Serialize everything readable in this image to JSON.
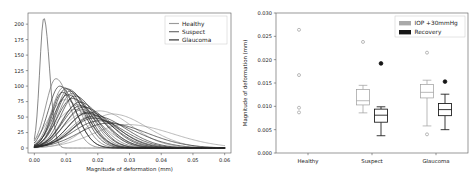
{
  "figure": {
    "panels": 2,
    "background": "#ffffff"
  },
  "chart_data": [
    {
      "id": "left-panel",
      "type": "line",
      "title": "",
      "xlabel": "Magnitude of deformation (mm)",
      "ylabel": "",
      "xlim": [
        -0.002,
        0.062
      ],
      "ylim": [
        -8,
        218
      ],
      "xticks": [
        0.0,
        0.01,
        0.02,
        0.03,
        0.04,
        0.05,
        0.06
      ],
      "xticklabels": [
        "0.00",
        "0.01",
        "0.02",
        "0.03",
        "0.04",
        "0.05",
        "0.06"
      ],
      "yticks": [
        0,
        25,
        50,
        75,
        100,
        125,
        150,
        175,
        200
      ],
      "yticklabels": [
        "0",
        "25",
        "50",
        "75",
        "100",
        "125",
        "150",
        "175",
        "200"
      ],
      "grid": false,
      "legend_position": "upper right",
      "legend": [
        {
          "label": "Healthy",
          "color": "#9a9a9a"
        },
        {
          "label": "Suspect",
          "color": "#6a6a6a"
        },
        {
          "label": "Glaucoma",
          "color": "#2b2b2b"
        }
      ],
      "description": "Overlaid kernel density estimate curves of corneal deformation magnitude for individual subjects in three groups.",
      "series": [
        {
          "name": "Healthy",
          "color": "#9a9a9a",
          "peak_x": 0.0205,
          "peak_y": 60,
          "spread": 0.0072
        },
        {
          "name": "Healthy",
          "color": "#9a9a9a",
          "peak_x": 0.0245,
          "peak_y": 55,
          "spread": 0.008
        },
        {
          "name": "Healthy",
          "color": "#9a9a9a",
          "peak_x": 0.0125,
          "peak_y": 62,
          "spread": 0.0062
        },
        {
          "name": "Healthy",
          "color": "#9a9a9a",
          "peak_x": 0.016,
          "peak_y": 57,
          "spread": 0.0068
        },
        {
          "name": "Healthy",
          "color": "#9a9a9a",
          "peak_x": 0.0095,
          "peak_y": 78,
          "spread": 0.005
        },
        {
          "name": "Healthy",
          "color": "#9a9a9a",
          "peak_x": 0.029,
          "peak_y": 38,
          "spread": 0.0105
        },
        {
          "name": "Suspect",
          "color": "#6a6a6a",
          "peak_x": 0.003,
          "peak_y": 210,
          "spread": 0.0013
        },
        {
          "name": "Suspect",
          "color": "#6a6a6a",
          "peak_x": 0.0068,
          "peak_y": 112,
          "spread": 0.0032
        },
        {
          "name": "Suspect",
          "color": "#6a6a6a",
          "peak_x": 0.0092,
          "peak_y": 98,
          "spread": 0.0038
        },
        {
          "name": "Suspect",
          "color": "#6a6a6a",
          "peak_x": 0.0108,
          "peak_y": 95,
          "spread": 0.004
        },
        {
          "name": "Suspect",
          "color": "#6a6a6a",
          "peak_x": 0.0118,
          "peak_y": 88,
          "spread": 0.0044
        },
        {
          "name": "Suspect",
          "color": "#6a6a6a",
          "peak_x": 0.0135,
          "peak_y": 70,
          "spread": 0.005
        },
        {
          "name": "Suspect",
          "color": "#6a6a6a",
          "peak_x": 0.015,
          "peak_y": 62,
          "spread": 0.0055
        },
        {
          "name": "Suspect",
          "color": "#6a6a6a",
          "peak_x": 0.0175,
          "peak_y": 50,
          "spread": 0.0065
        },
        {
          "name": "Glaucoma",
          "color": "#2b2b2b",
          "peak_x": 0.008,
          "peak_y": 100,
          "spread": 0.0036
        },
        {
          "name": "Glaucoma",
          "color": "#2b2b2b",
          "peak_x": 0.01,
          "peak_y": 96,
          "spread": 0.004
        },
        {
          "name": "Glaucoma",
          "color": "#2b2b2b",
          "peak_x": 0.0112,
          "peak_y": 92,
          "spread": 0.0042
        },
        {
          "name": "Glaucoma",
          "color": "#2b2b2b",
          "peak_x": 0.0128,
          "peak_y": 84,
          "spread": 0.0046
        },
        {
          "name": "Glaucoma",
          "color": "#2b2b2b",
          "peak_x": 0.0142,
          "peak_y": 74,
          "spread": 0.0052
        },
        {
          "name": "Glaucoma",
          "color": "#2b2b2b",
          "peak_x": 0.0155,
          "peak_y": 66,
          "spread": 0.0058
        },
        {
          "name": "Glaucoma",
          "color": "#2b2b2b",
          "peak_x": 0.017,
          "peak_y": 58,
          "spread": 0.0062
        },
        {
          "name": "Glaucoma",
          "color": "#2b2b2b",
          "peak_x": 0.019,
          "peak_y": 52,
          "spread": 0.007
        },
        {
          "name": "Glaucoma",
          "color": "#2b2b2b",
          "peak_x": 0.0088,
          "peak_y": 90,
          "spread": 0.0034
        },
        {
          "name": "Glaucoma",
          "color": "#2b2b2b",
          "peak_x": 0.012,
          "peak_y": 80,
          "spread": 0.0048
        },
        {
          "name": "Glaucoma",
          "color": "#2b2b2b",
          "peak_x": 0.0105,
          "peak_y": 86,
          "spread": 0.0044
        },
        {
          "name": "Glaucoma",
          "color": "#2b2b2b",
          "peak_x": 0.0145,
          "peak_y": 68,
          "spread": 0.0056
        },
        {
          "name": "Glaucoma",
          "color": "#2b2b2b",
          "peak_x": 0.0205,
          "peak_y": 44,
          "spread": 0.0082
        },
        {
          "name": "Glaucoma",
          "color": "#2b2b2b",
          "peak_x": 0.023,
          "peak_y": 40,
          "spread": 0.009
        },
        {
          "name": "Glaucoma",
          "color": "#2b2b2b",
          "peak_x": 0.0165,
          "peak_y": 56,
          "spread": 0.006
        },
        {
          "name": "Glaucoma",
          "color": "#2b2b2b",
          "peak_x": 0.0185,
          "peak_y": 48,
          "spread": 0.0068
        }
      ]
    },
    {
      "id": "right-panel",
      "type": "box",
      "title": "",
      "xlabel": "",
      "ylabel": "Magnitude of deformation (mm)",
      "ylim": [
        0.0,
        0.03
      ],
      "yticks": [
        0.0,
        0.005,
        0.01,
        0.015,
        0.02,
        0.025,
        0.03
      ],
      "yticklabels": [
        "0.000",
        "0.005",
        "0.010",
        "0.015",
        "0.020",
        "0.025",
        "0.030"
      ],
      "categories": [
        "Healthy",
        "Suspect",
        "Glaucoma"
      ],
      "grid": false,
      "legend_position": "upper right",
      "legend": [
        {
          "label": "IOP +30mmHg",
          "color": "#a9a9a9"
        },
        {
          "label": "Recovery",
          "color": "#151515"
        }
      ],
      "boxes": [
        {
          "category": "Healthy",
          "series": "IOP +30mmHg",
          "color": "#a9a9a9",
          "q1": null,
          "median": null,
          "q3": null,
          "whisker_low": null,
          "whisker_high": null,
          "outliers": [
            0.0264,
            0.0167,
            0.0097,
            0.0087
          ],
          "note": "collapsed box, outliers only"
        },
        {
          "category": "Healthy",
          "series": "Recovery",
          "color": "#151515",
          "q1": null,
          "median": null,
          "q3": null,
          "whisker_low": null,
          "whisker_high": null,
          "outliers": [],
          "note": "not drawn"
        },
        {
          "category": "Suspect",
          "series": "IOP +30mmHg",
          "color": "#a9a9a9",
          "q1": 0.0103,
          "median": 0.0112,
          "q3": 0.0136,
          "whisker_low": 0.0086,
          "whisker_high": 0.0145,
          "outliers": [
            0.0238
          ]
        },
        {
          "category": "Suspect",
          "series": "Recovery",
          "color": "#151515",
          "q1": 0.0066,
          "median": 0.0081,
          "q3": 0.0094,
          "whisker_low": 0.0037,
          "whisker_high": 0.0099,
          "outliers": [
            0.0192
          ]
        },
        {
          "category": "Glaucoma",
          "series": "IOP +30mmHg",
          "color": "#a9a9a9",
          "q1": 0.0118,
          "median": 0.013,
          "q3": 0.0147,
          "whisker_low": 0.0058,
          "whisker_high": 0.0156,
          "outliers": [
            0.0215,
            0.004
          ]
        },
        {
          "category": "Glaucoma",
          "series": "Recovery",
          "color": "#151515",
          "q1": 0.008,
          "median": 0.0093,
          "q3": 0.0106,
          "whisker_low": 0.005,
          "whisker_high": 0.0126,
          "outliers": [
            0.0153
          ]
        }
      ]
    }
  ]
}
